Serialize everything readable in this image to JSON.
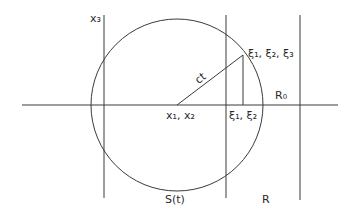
{
  "figure": {
    "labels": {
      "axis_x3": "x₃",
      "origin": "x₁, x₂",
      "radius": "ct",
      "point_3d": "ξ₁, ξ₂, ξ₃",
      "point_proj": "ξ₁, ξ₂",
      "sphere": "S(t)",
      "region_R": "R",
      "region_R0": "R₀"
    },
    "colors": {
      "line": "#3a3a3a",
      "background": "#ffffff"
    }
  }
}
